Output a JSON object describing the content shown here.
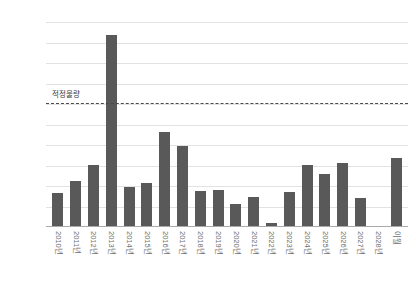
{
  "chart_data": {
    "type": "bar",
    "title": "",
    "subtitle": "",
    "xlabel": "",
    "ylabel": "",
    "ylim": [
      0,
      5000
    ],
    "ytick_labels": [
      "5,000",
      "4,500",
      "4,000",
      "3,500",
      "3,000",
      ",2500",
      "2,000",
      "1,500",
      "1,000",
      "500",
      "0"
    ],
    "ytick_values": [
      5000,
      4500,
      4000,
      3500,
      3000,
      2500,
      2000,
      1500,
      1000,
      500,
      0
    ],
    "grid": true,
    "legend": "none",
    "bar_color": "#595959",
    "gridline_color": "#e2e2e2",
    "axis_color": "#a9a9a9",
    "categories": [
      "2010년",
      "2011년",
      "2012년",
      "2013년",
      "2014년",
      "2015년",
      "2016년",
      "2017년",
      "2018년",
      "2019년",
      "2020년",
      "2021년",
      "2022년",
      "2023년",
      "2024년",
      "2025년",
      "2026년",
      "2027년",
      "2028년",
      "이월"
    ],
    "values": [
      800,
      1100,
      1500,
      4650,
      950,
      1050,
      2300,
      1950,
      850,
      880,
      540,
      700,
      70,
      830,
      1480,
      1280,
      1540,
      680,
      0,
      1650
    ],
    "annotations": [
      {
        "label": "적정물량",
        "type": "threshold-line",
        "value": 3000,
        "style": "dashed",
        "color": "#4a4a4a"
      }
    ]
  }
}
